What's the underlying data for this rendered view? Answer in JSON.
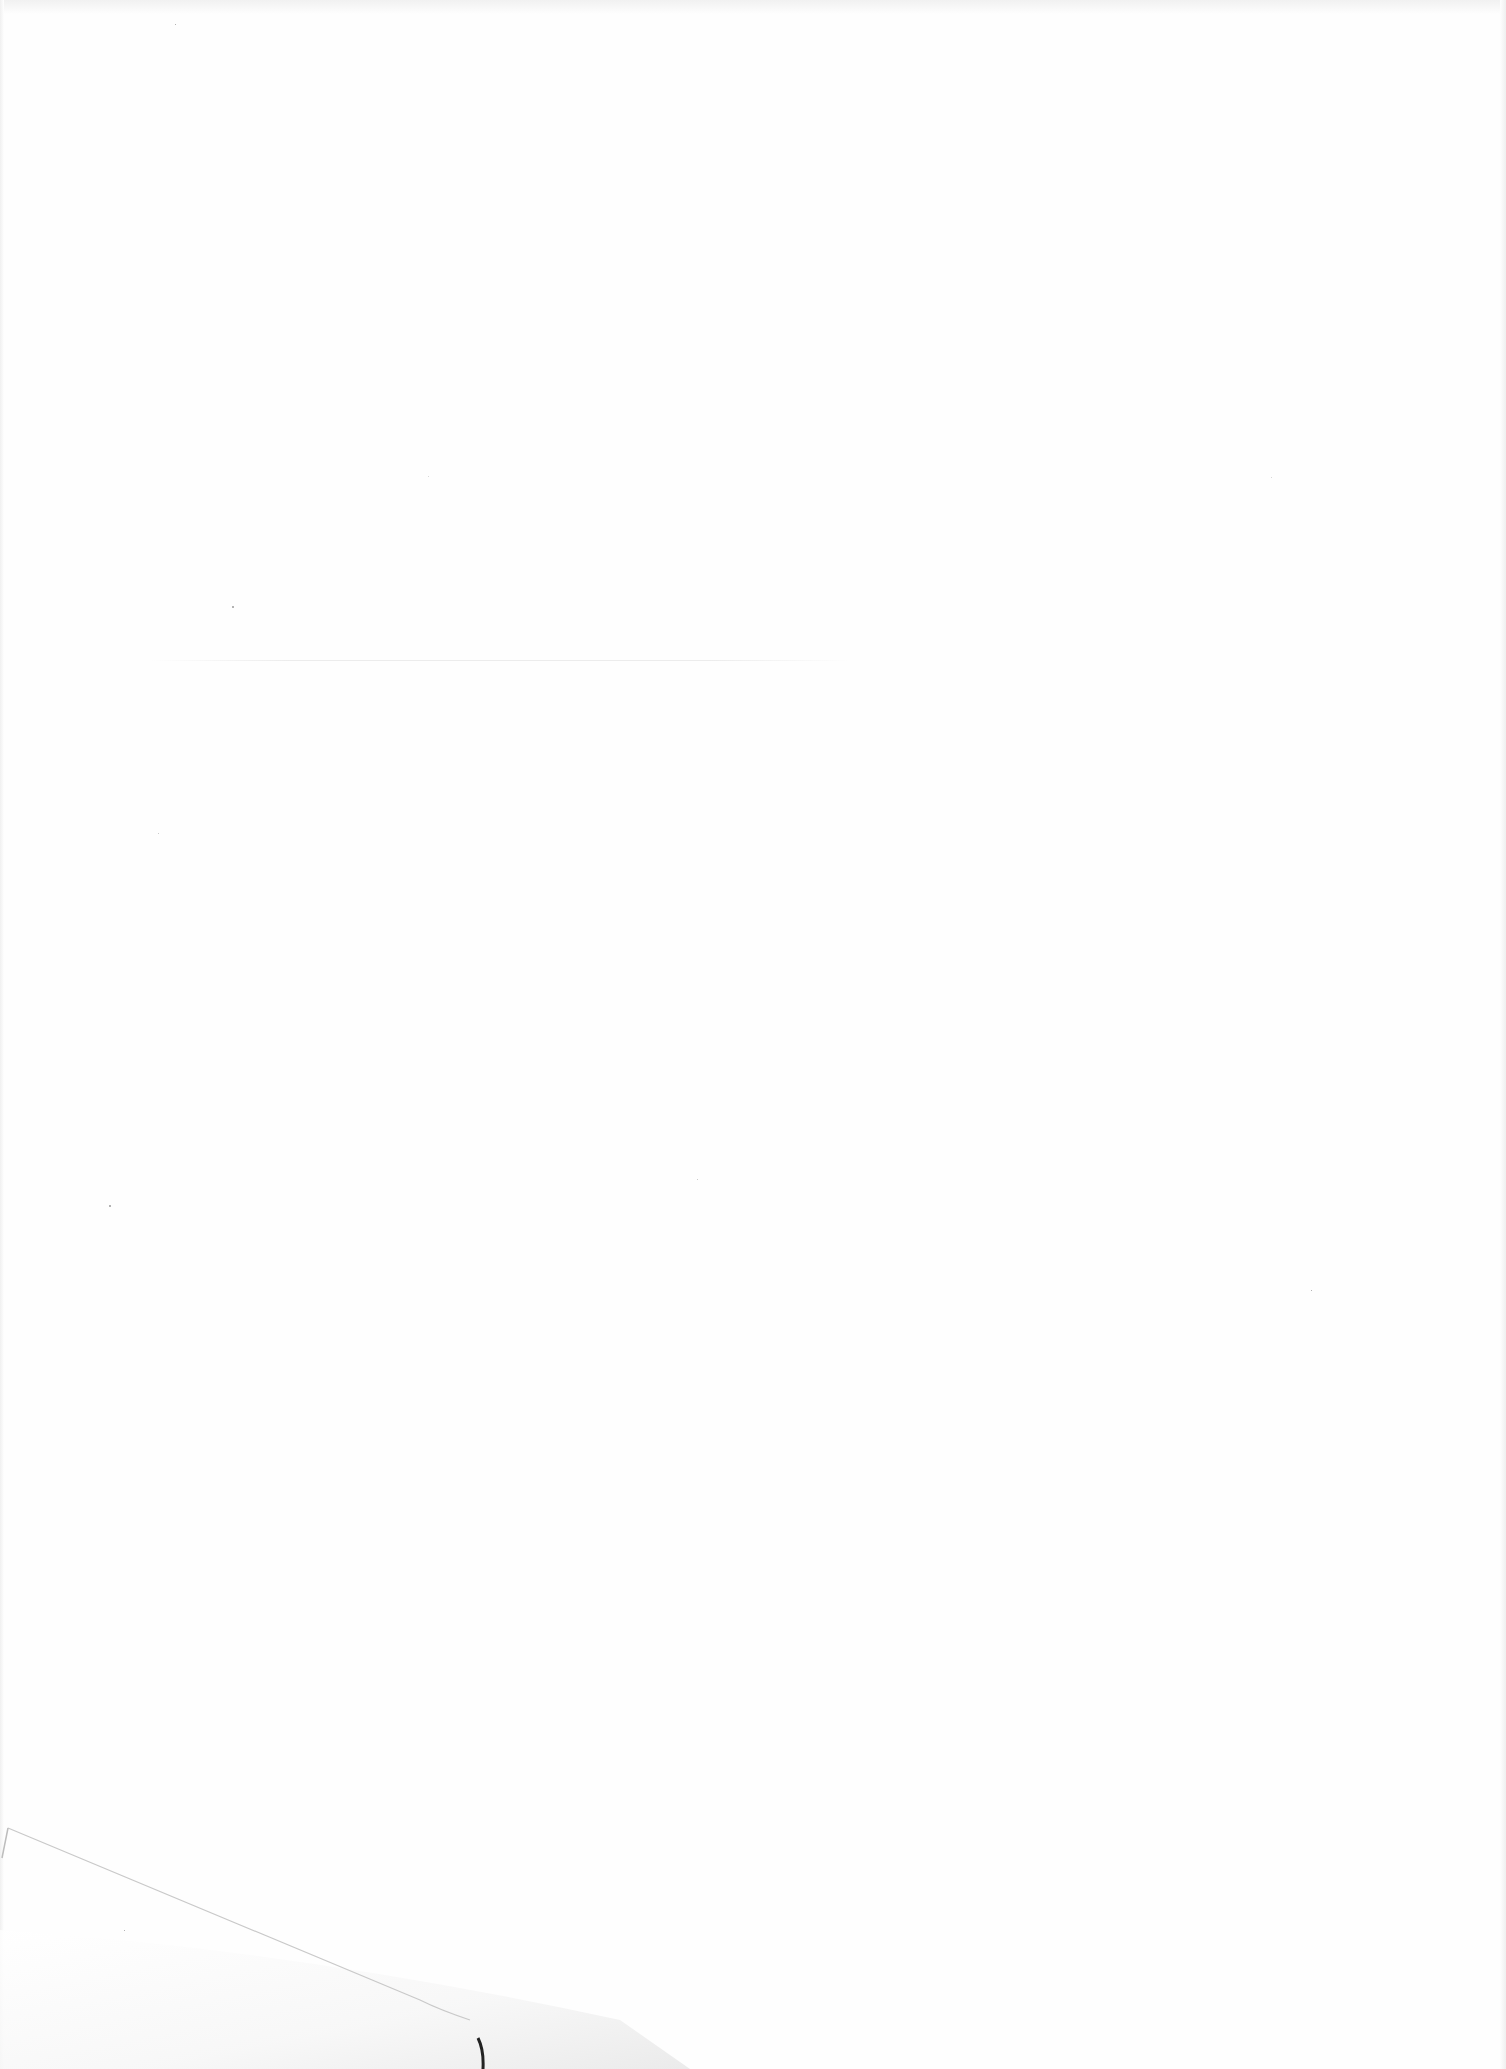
{
  "page": {
    "background_color": "#fefefe",
    "features": [
      "folded-corner-bottom-left"
    ]
  }
}
